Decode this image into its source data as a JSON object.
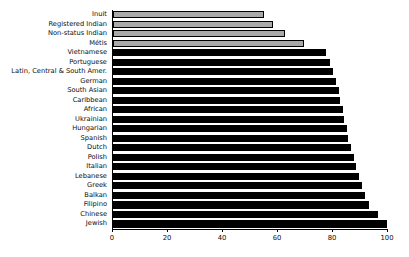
{
  "chart_data": {
    "type": "bar",
    "orientation": "horizontal",
    "title": "",
    "xlabel": "",
    "ylabel": "",
    "xlim": [
      0,
      100
    ],
    "xticks": [
      0,
      20,
      40,
      60,
      80,
      100
    ],
    "xtick_labels": [
      "0",
      "20",
      "40",
      "60",
      "80",
      "100"
    ],
    "grid": false,
    "legend": null,
    "categories": [
      "Inuit",
      "Registered Indian",
      "Non-status Indian",
      "Métis",
      "Vietnamese",
      "Portuguese",
      "Latin, Central & South Amer.",
      "German",
      "South Asian",
      "Caribbean",
      "African",
      "Ukrainian",
      "Hungarian",
      "Spanish",
      "Dutch",
      "Polish",
      "Italian",
      "Lebanese",
      "Greek",
      "Balkan",
      "Filipino",
      "Chinese",
      "Jewish"
    ],
    "values": [
      55.0,
      58.0,
      62.5,
      69.5,
      77.5,
      79.0,
      80.0,
      81.0,
      82.0,
      82.5,
      83.5,
      84.0,
      85.0,
      85.5,
      86.5,
      87.5,
      88.5,
      89.5,
      90.5,
      91.5,
      93.0,
      96.5,
      99.5
    ],
    "bar_colors": [
      "#a9a9a9",
      "#a9a9a9",
      "#a9a9a9",
      "#a9a9a9",
      "#000000",
      "#000000",
      "#000000",
      "#000000",
      "#000000",
      "#000000",
      "#000000",
      "#000000",
      "#000000",
      "#000000",
      "#000000",
      "#000000",
      "#000000",
      "#000000",
      "#000000",
      "#000000",
      "#000000",
      "#000000",
      "#000000"
    ],
    "colors": {
      "aboriginal_group": "#a9a9a9",
      "other_group": "#000000",
      "axis": "#000000",
      "text": "#0d0d0d",
      "background": "#ffffff"
    }
  }
}
